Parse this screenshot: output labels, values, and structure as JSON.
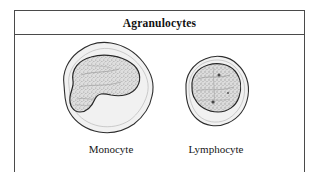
{
  "figure": {
    "title": "Agranulocytes",
    "background_color": "#ffffff",
    "border_color": "#4a4a4a",
    "ink_color": "#1a1a1a",
    "cytoplasm_color": "#f0f0f0",
    "nucleus_color": "#d8d8d8",
    "cells": [
      {
        "id": "monocyte",
        "label": "Monocyte",
        "cell_shape": "irregular-amoeboid",
        "nucleus_shape": "kidney-bean",
        "nucleus_relative_size": "large"
      },
      {
        "id": "lymphocyte",
        "label": "Lymphocyte",
        "cell_shape": "round",
        "nucleus_shape": "round",
        "nucleus_relative_size": "very-large"
      }
    ]
  }
}
